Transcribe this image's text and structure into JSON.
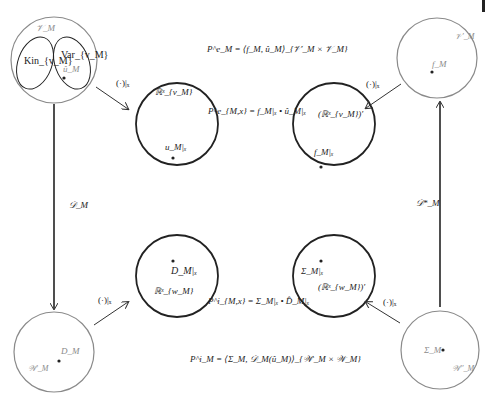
{
  "diagram": {
    "type": "commutative-diagram",
    "colors": {
      "outer_circle": "#8a8a8a",
      "inner_circle": "#222222",
      "arrow": "#333333",
      "text_gray": "#8a8a8a",
      "text_dark": "#222222"
    },
    "nodes": {
      "top_left": {
        "space_label": "𝒱_M",
        "subsets": [
          {
            "label": "Kin_{v_M}"
          },
          {
            "label": "Var_{v_M}"
          }
        ],
        "point_label": "û_M"
      },
      "top_right": {
        "space_label": "𝒱′_M",
        "point_label": "f_M"
      },
      "bottom_left": {
        "space_label": "𝒲′_M",
        "point_label": "D_M"
      },
      "bottom_right": {
        "space_label": "𝒲′′_M",
        "point_label": "Σ_M"
      },
      "inner_top_left": {
        "space_label": "ℝˣ_{v_M}",
        "point_label": "u_M|ₓ"
      },
      "inner_top_right": {
        "space_label": "(ℝˣ_{v_M})′",
        "point_label": "f_M|ₓ"
      },
      "inner_bottom_left": {
        "space_label": "ℝˣ_{w_M}",
        "point_label": "D_M|ₓ"
      },
      "inner_bottom_right": {
        "space_label": "(ℝˣ_{w_M})′",
        "point_label": "Σ_M|ₓ"
      }
    },
    "arrows": {
      "restriction_label": "(·)|ₓ",
      "left_vertical_label": "𝒟_M",
      "right_vertical_label": "𝒟*_M"
    },
    "equations": {
      "top": "P^e_M = ⟨f_M, û_M⟩_{𝒱′_M × 𝒱_M}",
      "upper_mid": "P^e_{M,x} = f_M|ₓ • û_M|ₓ",
      "lower_mid": "P^i_{M,x} = Σ_M|ₓ • D̂_M|ₓ",
      "bottom": "P^i_M = ⟨Σ_M, 𝒟_M(û_M)⟩_{𝒲′_M × 𝒲_M}"
    }
  }
}
